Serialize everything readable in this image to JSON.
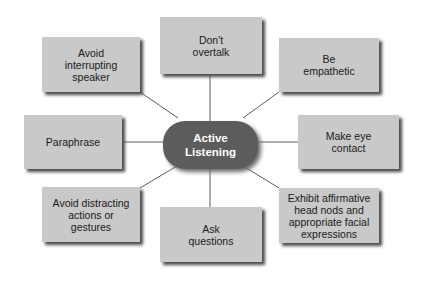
{
  "diagram": {
    "title": "Active Listening",
    "center": {
      "label": "Active\nListening",
      "color": "#5c5c5c",
      "text_color": "#ffffff"
    },
    "box_color": "#c9c9c9",
    "line_color": "#333333",
    "nodes": [
      {
        "id": "avoid-interrupting",
        "label": "Avoid\ninterrupting\nspeaker"
      },
      {
        "id": "dont-overtalk",
        "label": "Don't\novertalk"
      },
      {
        "id": "be-empathetic",
        "label": "Be\nempathetic"
      },
      {
        "id": "paraphrase",
        "label": "Paraphrase"
      },
      {
        "id": "make-eye-contact",
        "label": "Make eye\ncontact"
      },
      {
        "id": "avoid-distracting",
        "label": "Avoid distracting\nactions or\ngestures"
      },
      {
        "id": "ask-questions",
        "label": "Ask\nquestions"
      },
      {
        "id": "exhibit-affirmative",
        "label": "Exhibit affirmative\nhead nods and\nappropriate facial\nexpressions"
      }
    ]
  }
}
